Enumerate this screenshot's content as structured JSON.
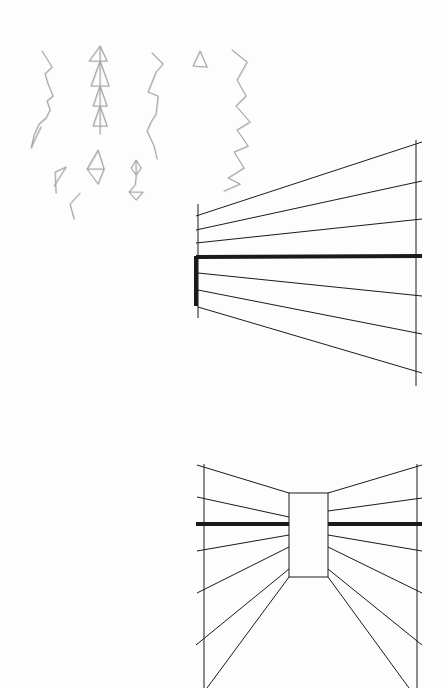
{
  "page": {
    "width": 447,
    "height": 688,
    "background": "#fdfdfd",
    "ink_color": "#1a1a1a",
    "pencil_color": "#a9a9a9"
  },
  "sketches": {
    "description": "Pencil doodles of chained triangles (no text)",
    "chains": [
      {
        "name": "chain-1",
        "points": [
          [
            42,
            51
          ],
          [
            52,
            67
          ],
          [
            45,
            74
          ],
          [
            48,
            84
          ],
          [
            53,
            96
          ],
          [
            47,
            101
          ],
          [
            50,
            110
          ],
          [
            46,
            118
          ],
          [
            39,
            124
          ],
          [
            34,
            135
          ],
          [
            31,
            148
          ],
          [
            35,
            139
          ],
          [
            41,
            127
          ]
        ]
      },
      {
        "name": "chain-2",
        "points": [
          [
            100,
            46
          ],
          [
            89,
            61
          ],
          [
            107,
            61
          ],
          [
            100,
            46
          ],
          [
            100,
            61
          ],
          [
            91,
            86
          ],
          [
            109,
            86
          ],
          [
            100,
            61
          ],
          [
            100,
            86
          ],
          [
            93,
            106
          ],
          [
            107,
            106
          ],
          [
            100,
            86
          ],
          [
            100,
            106
          ],
          [
            93,
            126
          ],
          [
            107,
            126
          ],
          [
            100,
            106
          ],
          [
            100,
            126
          ],
          [
            100,
            134
          ]
        ]
      },
      {
        "name": "chain-3",
        "points": [
          [
            152,
            53
          ],
          [
            163,
            64
          ],
          [
            156,
            72
          ],
          [
            148,
            92
          ],
          [
            158,
            96
          ],
          [
            156,
            114
          ],
          [
            151,
            122
          ],
          [
            147,
            131
          ],
          [
            154,
            146
          ],
          [
            157,
            159
          ]
        ]
      },
      {
        "name": "triangle-1",
        "points": [
          [
            200,
            51
          ],
          [
            193,
            66
          ],
          [
            207,
            67
          ],
          [
            200,
            51
          ]
        ]
      },
      {
        "name": "chain-4",
        "points": [
          [
            232,
            50
          ],
          [
            247,
            62
          ],
          [
            237,
            80
          ],
          [
            246,
            96
          ],
          [
            236,
            106
          ],
          [
            250,
            122
          ],
          [
            237,
            130
          ],
          [
            248,
            146
          ],
          [
            234,
            152
          ],
          [
            244,
            168
          ],
          [
            228,
            178
          ],
          [
            240,
            184
          ],
          [
            224,
            191
          ]
        ]
      },
      {
        "name": "diamond-1",
        "points": [
          [
            98,
            150
          ],
          [
            87,
            169
          ],
          [
            104,
            169
          ],
          [
            98,
            150
          ],
          [
            87,
            169
          ],
          [
            98,
            184
          ],
          [
            104,
            169
          ]
        ]
      },
      {
        "name": "chain-5",
        "points": [
          [
            54,
            186
          ],
          [
            66,
            167
          ],
          [
            55,
            172
          ],
          [
            56,
            193
          ]
        ]
      },
      {
        "name": "stick-1",
        "points": [
          [
            80,
            193
          ],
          [
            70,
            204
          ],
          [
            74,
            219
          ]
        ]
      },
      {
        "name": "pendant-1",
        "points": [
          [
            136,
            160
          ],
          [
            131,
            168
          ],
          [
            136,
            175
          ],
          [
            141,
            168
          ],
          [
            136,
            160
          ],
          [
            136,
            178
          ],
          [
            135,
            185
          ],
          [
            129,
            192
          ],
          [
            143,
            192
          ],
          [
            136,
            200
          ],
          [
            129,
            192
          ]
        ]
      }
    ]
  },
  "perspective_1": {
    "description": "One-point perspective, vanishing to the left",
    "left_vertical": {
      "x": 198,
      "y1": 204,
      "y2": 318
    },
    "right_vertical": {
      "x": 416,
      "y1": 140,
      "y2": 386
    },
    "thick_vertical": {
      "x": 196,
      "y1": 256,
      "y2": 306,
      "width": 4
    },
    "lines": [
      {
        "x1": 196,
        "y1": 216,
        "x2": 422,
        "y2": 142,
        "width": 1
      },
      {
        "x1": 196,
        "y1": 230,
        "x2": 422,
        "y2": 181,
        "width": 1
      },
      {
        "x1": 196,
        "y1": 243,
        "x2": 422,
        "y2": 219,
        "width": 1
      },
      {
        "x1": 196,
        "y1": 257,
        "x2": 422,
        "y2": 256,
        "width": 4
      },
      {
        "x1": 198,
        "y1": 273,
        "x2": 422,
        "y2": 296,
        "width": 1
      },
      {
        "x1": 198,
        "y1": 290,
        "x2": 422,
        "y2": 334,
        "width": 1
      },
      {
        "x1": 198,
        "y1": 307,
        "x2": 422,
        "y2": 373,
        "width": 1
      }
    ]
  },
  "perspective_2": {
    "description": "One-point perspective corridor with central back wall",
    "left_vertical": {
      "x": 204,
      "y1": 464,
      "y2": 688
    },
    "right_vertical": {
      "x": 417,
      "y1": 464,
      "y2": 688
    },
    "back_wall": {
      "x": 289,
      "y": 493,
      "width": 39,
      "height": 84
    },
    "lines": [
      {
        "x1": 197,
        "y1": 465,
        "x2": 289,
        "y2": 493,
        "width": 1
      },
      {
        "x1": 197,
        "y1": 497,
        "x2": 289,
        "y2": 517,
        "width": 1
      },
      {
        "x1": 196,
        "y1": 524,
        "x2": 289,
        "y2": 524,
        "width": 4
      },
      {
        "x1": 197,
        "y1": 551,
        "x2": 289,
        "y2": 535,
        "width": 1
      },
      {
        "x1": 197,
        "y1": 593,
        "x2": 289,
        "y2": 547,
        "width": 1
      },
      {
        "x1": 196,
        "y1": 645,
        "x2": 289,
        "y2": 569,
        "width": 1
      },
      {
        "x1": 207,
        "y1": 688,
        "x2": 289,
        "y2": 577,
        "width": 1
      },
      {
        "x1": 328,
        "y1": 493,
        "x2": 422,
        "y2": 465,
        "width": 1
      },
      {
        "x1": 328,
        "y1": 511,
        "x2": 422,
        "y2": 498,
        "width": 1
      },
      {
        "x1": 328,
        "y1": 524,
        "x2": 422,
        "y2": 524,
        "width": 4
      },
      {
        "x1": 328,
        "y1": 535,
        "x2": 422,
        "y2": 551,
        "width": 1
      },
      {
        "x1": 328,
        "y1": 547,
        "x2": 422,
        "y2": 593,
        "width": 1
      },
      {
        "x1": 328,
        "y1": 569,
        "x2": 422,
        "y2": 645,
        "width": 1
      },
      {
        "x1": 328,
        "y1": 577,
        "x2": 409,
        "y2": 688,
        "width": 1
      }
    ]
  }
}
